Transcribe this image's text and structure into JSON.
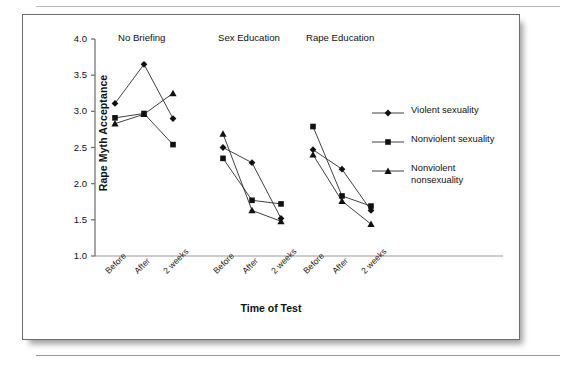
{
  "figure": {
    "y_axis_label": "Rape Myth Acceptance",
    "x_axis_label": "Time of Test"
  },
  "chart_data": {
    "type": "line",
    "title": "",
    "xlabel": "Time of Test",
    "ylabel": "Rape Myth Acceptance",
    "ylim": [
      1.0,
      4.0
    ],
    "yticks": [
      "1.0",
      "1.5",
      "2.0",
      "2.5",
      "3.0",
      "3.5",
      "4.0"
    ],
    "ytick_values": [
      1.0,
      1.5,
      2.0,
      2.5,
      3.0,
      3.5,
      4.0
    ],
    "grid": false,
    "legend_position": "right",
    "groups": [
      "No Briefing",
      "Sex Education",
      "Rape Education"
    ],
    "categories": [
      "Before",
      "After",
      "2 weeks"
    ],
    "series": [
      {
        "name": "Violent sexuality",
        "marker": "diamond",
        "values": {
          "No Briefing": [
            3.11,
            3.65,
            2.9
          ],
          "Sex Education": [
            2.5,
            2.29,
            1.52
          ],
          "Rape Education": [
            2.47,
            2.2,
            1.63
          ]
        }
      },
      {
        "name": "Nonviolent sexuality",
        "marker": "square",
        "values": {
          "No Briefing": [
            2.91,
            2.97,
            2.54
          ],
          "Sex Education": [
            2.35,
            1.77,
            1.72
          ],
          "Rape Education": [
            2.79,
            1.83,
            1.69
          ]
        }
      },
      {
        "name": "Nonviolent nonsexuality",
        "marker": "triangle",
        "values": {
          "No Briefing": [
            2.83,
            2.96,
            3.25
          ],
          "Sex Education": [
            2.69,
            1.63,
            1.48
          ],
          "Rape Education": [
            2.4,
            1.76,
            1.44
          ]
        }
      }
    ]
  },
  "legend": {
    "items": [
      {
        "label": "Violent sexuality",
        "marker": "diamond"
      },
      {
        "label": "Nonviolent sexuality",
        "marker": "square"
      },
      {
        "label": "Nonviolent\nnonsexuality",
        "marker": "triangle"
      }
    ]
  }
}
